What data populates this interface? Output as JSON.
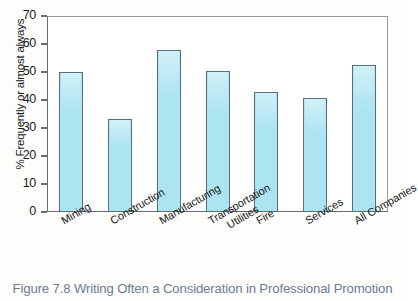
{
  "caption": "Figure 7.8  Writing Often a Consideration in Professional Promotion",
  "colors": {
    "bar_fill": "#ACE4F2",
    "bar_border": "#57707C",
    "axis": "#6A6A6A",
    "caption_text": "#6D7C93",
    "background": "#FFFFFF"
  },
  "chart_data": {
    "type": "bar",
    "title": "",
    "subtitle": "",
    "xlabel": "",
    "ylabel": "% Frequently or almost always",
    "ylim": [
      0,
      70
    ],
    "ytick_step": 10,
    "yticks": [
      0,
      10,
      20,
      30,
      40,
      50,
      60,
      70
    ],
    "ytick_labels": [
      "0",
      "10",
      "20",
      "30",
      "40",
      "50",
      "60",
      "70"
    ],
    "grid": false,
    "legend": false,
    "legend_position": "none",
    "categories": [
      "Mining",
      "Construction",
      "Manufacturing",
      "Transportation Utilities",
      "Fire",
      "Services",
      "All Companies"
    ],
    "category_lines": [
      [
        "Mining"
      ],
      [
        "Construction"
      ],
      [
        "Manufacturing"
      ],
      [
        "Transportation",
        "Utilities"
      ],
      [
        "Fire"
      ],
      [
        "Services"
      ],
      [
        "All Companies"
      ]
    ],
    "values": [
      50,
      33.3,
      58,
      50.4,
      43,
      40.6,
      52.5
    ],
    "series": [
      {
        "name": "% Frequently or almost always",
        "values": [
          50,
          33.3,
          58,
          50.4,
          43,
          40.6,
          52.5
        ]
      }
    ]
  }
}
